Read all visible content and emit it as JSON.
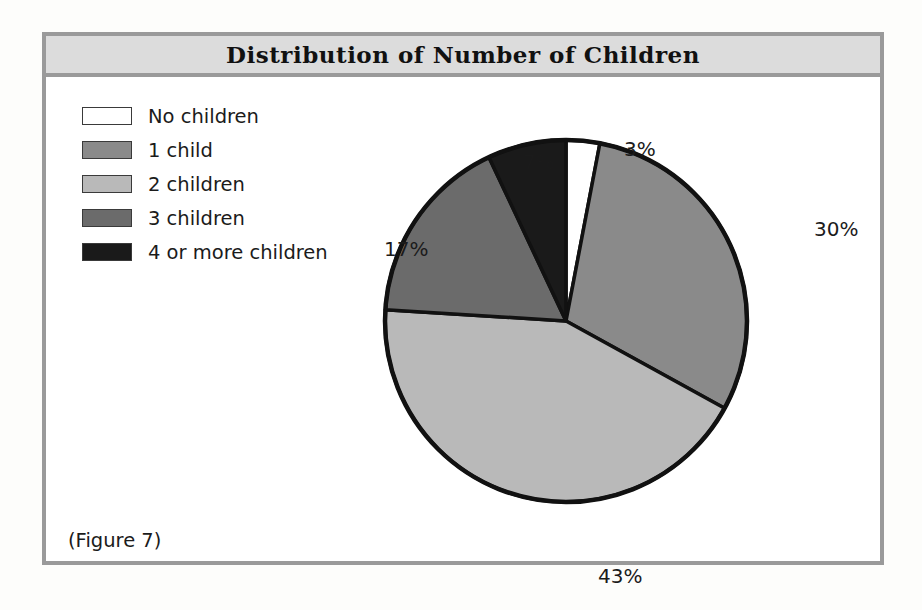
{
  "figure": {
    "title": "Distribution of Number of Children",
    "caption": "(Figure 7)"
  },
  "legend": {
    "items": [
      {
        "label": "No children",
        "color": "#ffffff"
      },
      {
        "label": "1 child",
        "color": "#8a8a8a"
      },
      {
        "label": "2 children",
        "color": "#b9b9b9"
      },
      {
        "label": "3 children",
        "color": "#6b6b6b"
      },
      {
        "label": "4 or more children",
        "color": "#1a1a1a"
      }
    ]
  },
  "labels": {
    "pct": [
      "3%",
      "30%",
      "43%",
      "17%",
      "7%"
    ]
  },
  "chart_data": {
    "type": "pie",
    "title": "Distribution of Number of Children",
    "categories": [
      "No children",
      "1 child",
      "2 children",
      "3 children",
      "4 or more children"
    ],
    "values": [
      3,
      30,
      43,
      17,
      7
    ],
    "value_labels": [
      "3%",
      "30%",
      "43%",
      "17%",
      "7%"
    ],
    "unit": "percent",
    "colors": [
      "#ffffff",
      "#8a8a8a",
      "#b9b9b9",
      "#6b6b6b",
      "#1a1a1a"
    ],
    "start_angle_deg": 0,
    "direction": "clockwise",
    "legend_position": "top-left",
    "grid": false,
    "xlabel": "",
    "ylabel": ""
  }
}
